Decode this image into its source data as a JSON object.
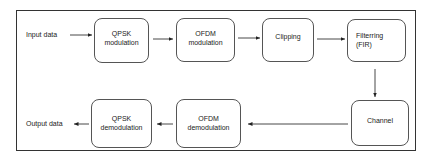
{
  "diagram": {
    "title": "",
    "input_label": "Input data",
    "output_label": "Output data",
    "nodes": [
      {
        "id": "qpsk-mod",
        "lines": [
          "QPSK",
          "modulation"
        ]
      },
      {
        "id": "ofdm-mod",
        "lines": [
          "OFDM",
          "modulation"
        ]
      },
      {
        "id": "clipping",
        "lines": [
          "Clipping"
        ]
      },
      {
        "id": "filtering",
        "lines": [
          "Filterring",
          "(FIR)"
        ]
      },
      {
        "id": "channel",
        "lines": [
          "Channel"
        ]
      },
      {
        "id": "ofdm-demod",
        "lines": [
          "OFDM",
          "demodulation"
        ]
      },
      {
        "id": "qpsk-demod",
        "lines": [
          "QPSK",
          "demodulation"
        ]
      }
    ],
    "edges": [
      {
        "from": "Input data",
        "to": "qpsk-mod"
      },
      {
        "from": "qpsk-mod",
        "to": "ofdm-mod"
      },
      {
        "from": "ofdm-mod",
        "to": "clipping"
      },
      {
        "from": "clipping",
        "to": "filtering"
      },
      {
        "from": "filtering",
        "to": "channel"
      },
      {
        "from": "channel",
        "to": "ofdm-demod"
      },
      {
        "from": "ofdm-demod",
        "to": "qpsk-demod"
      },
      {
        "from": "qpsk-demod",
        "to": "Output data"
      }
    ],
    "colors": {
      "stroke": "#333333",
      "box_border": "#555555",
      "background": "#ffffff"
    }
  }
}
